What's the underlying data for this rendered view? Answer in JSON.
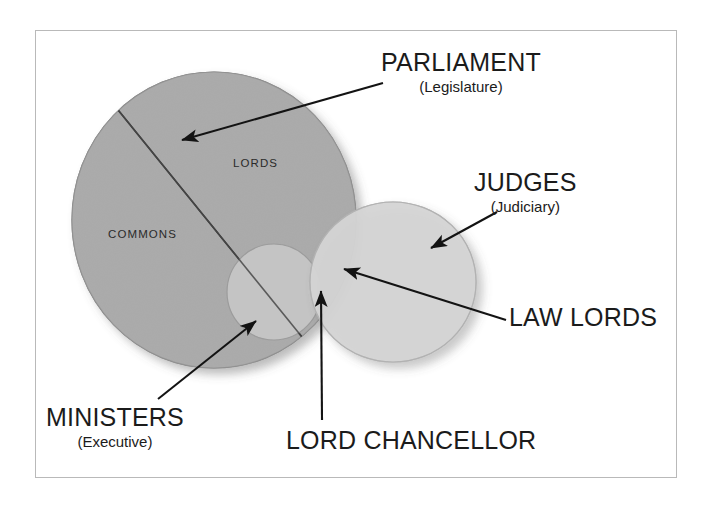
{
  "figure": {
    "frame_color": "#b9b9b9",
    "background": "#ffffff",
    "text_color": "#1b1b1b"
  },
  "shapes": {
    "parliament": {
      "name": "PARLIAMENT",
      "fill": "#a8a8a8",
      "stroke": "#8f8f8f",
      "cx": 214,
      "cy": 220,
      "rx": 142,
      "ry": 148
    },
    "judges": {
      "name": "JUDGES",
      "fill": "#cfcfcf",
      "stroke": "#b5b5b5",
      "cx": 393,
      "cy": 282,
      "rx": 83,
      "ry": 80
    },
    "ministers": {
      "name": "MINISTERS",
      "fill": "#c6c6c6",
      "stroke": "#a5a5a5",
      "cx": 274,
      "cy": 292,
      "rx": 47,
      "ry": 48
    }
  },
  "inner_labels": {
    "commons": "COMMONS",
    "lords": "LORDS"
  },
  "callouts": [
    {
      "id": "parliament",
      "main": "PARLIAMENT",
      "sub": "(Legislature)",
      "arrow_from": [
        383,
        83
      ],
      "arrow_to": [
        178,
        141
      ]
    },
    {
      "id": "judges",
      "main": "JUDGES",
      "sub": "(Judiciary)",
      "arrow_from": [
        497,
        213
      ],
      "arrow_to": [
        428,
        250
      ]
    },
    {
      "id": "law-lords",
      "main": "LAW LORDS",
      "sub": "",
      "arrow_from": [
        505,
        320
      ],
      "arrow_to": [
        340,
        268
      ]
    },
    {
      "id": "ministers",
      "main": "MINISTERS",
      "sub": "(Executive)",
      "arrow_from": [
        158,
        399
      ],
      "arrow_to": [
        258,
        320
      ]
    },
    {
      "id": "lord-chancellor",
      "main": "LORD CHANCELLOR",
      "sub": "",
      "arrow_from": [
        322,
        420
      ],
      "arrow_to": [
        320,
        288
      ]
    }
  ],
  "divider": {
    "name": "commons-lords-divider",
    "from": [
      118,
      108
    ],
    "to": [
      322,
      360
    ]
  }
}
